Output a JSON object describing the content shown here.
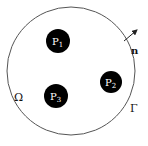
{
  "diagram": {
    "domain": {
      "label": "Ω",
      "boundary_label": "Γ",
      "normal_label": "n",
      "circle": {
        "cx": 71,
        "cy": 71,
        "r": 64,
        "stroke": "#555555"
      }
    },
    "particles": [
      {
        "name": "P",
        "sub": "1",
        "cx": 58,
        "cy": 41,
        "r": 12,
        "fill": "#000000"
      },
      {
        "name": "P",
        "sub": "2",
        "cx": 111,
        "cy": 82,
        "r": 11,
        "fill": "#000000"
      },
      {
        "name": "P",
        "sub": "3",
        "cx": 56,
        "cy": 96,
        "r": 12,
        "fill": "#000000"
      }
    ]
  }
}
